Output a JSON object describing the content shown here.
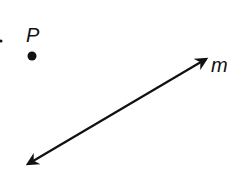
{
  "diagram": {
    "point": {
      "label": "P"
    },
    "line": {
      "label": "m"
    },
    "colors": {
      "ink": "#111111",
      "background": "#ffffff"
    }
  }
}
